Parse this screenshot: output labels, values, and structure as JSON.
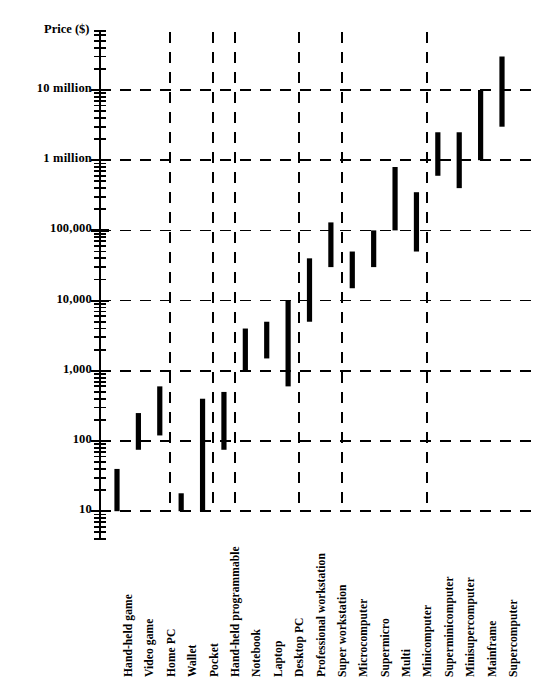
{
  "chart_data": {
    "type": "bar",
    "chart_style": "floating-range-bars",
    "title": "",
    "xlabel": "",
    "ylabel": "Price ($)",
    "yscale": "log",
    "ylim": [
      8,
      40000000
    ],
    "grid": {
      "horizontal": true,
      "vertical": true,
      "style": "dashed",
      "horizontal_values": [
        10,
        100,
        1000,
        10000,
        100000,
        1000000,
        10000000
      ],
      "vertical_after_categories": [
        "Home PC",
        "Pocket",
        "Hand-held programmable",
        "Desktop PC",
        "Super workstation",
        "Minicomputer"
      ]
    },
    "ytick_labels": [
      "10",
      "100",
      "1,000",
      "10,000",
      "100,000",
      "1 million",
      "10 million"
    ],
    "ytick_values": [
      10,
      100,
      1000,
      10000,
      100000,
      1000000,
      10000000
    ],
    "categories": [
      "Hand-held game",
      "Video game",
      "Home PC",
      "Wallet",
      "Pocket",
      "Hand-held programmable",
      "Notebook",
      "Laptop",
      "Desktop PC",
      "Professional workstation",
      "Super workstation",
      "Microcomputer",
      "Supermicro",
      "Multi",
      "Minicomputer",
      "Superminicomputer",
      "Minisupercomputer",
      "Mainframe",
      "Supercomputer"
    ],
    "ranges": [
      {
        "label": "Hand-held game",
        "low": 10,
        "high": 40
      },
      {
        "label": "Video game",
        "low": 75,
        "high": 250
      },
      {
        "label": "Home PC",
        "low": 120,
        "high": 600
      },
      {
        "label": "Wallet",
        "low": 10,
        "high": 18
      },
      {
        "label": "Pocket",
        "low": 10,
        "high": 400
      },
      {
        "label": "Hand-held programmable",
        "low": 75,
        "high": 500
      },
      {
        "label": "Notebook",
        "low": 1000,
        "high": 4000
      },
      {
        "label": "Laptop",
        "low": 1500,
        "high": 5000
      },
      {
        "label": "Desktop PC",
        "low": 600,
        "high": 10000
      },
      {
        "label": "Professional workstation",
        "low": 5000,
        "high": 40000
      },
      {
        "label": "Super workstation",
        "low": 30000,
        "high": 130000
      },
      {
        "label": "Microcomputer",
        "low": 15000,
        "high": 50000
      },
      {
        "label": "Supermicro",
        "low": 30000,
        "high": 100000
      },
      {
        "label": "Multi",
        "low": 100000,
        "high": 800000
      },
      {
        "label": "Minicomputer",
        "low": 50000,
        "high": 350000
      },
      {
        "label": "Superminicomputer",
        "low": 600000,
        "high": 2500000
      },
      {
        "label": "Minisupercomputer",
        "low": 400000,
        "high": 2500000
      },
      {
        "label": "Mainframe",
        "low": 1000000,
        "high": 10000000
      },
      {
        "label": "Supercomputer",
        "low": 3000000,
        "high": 30000000
      }
    ],
    "colors": {
      "bar": "#000000",
      "axis": "#000000",
      "grid": "#000000",
      "background": "#ffffff"
    }
  }
}
